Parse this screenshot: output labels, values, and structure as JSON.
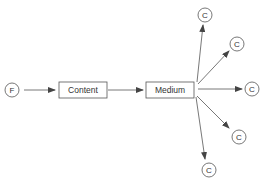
{
  "diagram": {
    "colors": {
      "stroke": "#555555",
      "text": "#333333",
      "background": "#ffffff"
    },
    "source": {
      "label": "F",
      "cx": 12,
      "cy": 90,
      "r": 7
    },
    "content_box": {
      "label": "Content",
      "x": 59,
      "y": 82,
      "w": 48,
      "h": 16
    },
    "medium_box": {
      "label": "Medium",
      "x": 146,
      "y": 82,
      "w": 48,
      "h": 16
    },
    "consumers": [
      {
        "label": "C",
        "cx": 205,
        "cy": 15,
        "r": 7
      },
      {
        "label": "C",
        "cx": 237,
        "cy": 44,
        "r": 7
      },
      {
        "label": "C",
        "cx": 252,
        "cy": 89,
        "r": 7
      },
      {
        "label": "C",
        "cx": 239,
        "cy": 137,
        "r": 7
      },
      {
        "label": "C",
        "cx": 209,
        "cy": 170,
        "r": 7
      }
    ],
    "edges": [
      {
        "from": "F",
        "to": "Content",
        "x1": 24,
        "y1": 90,
        "x2": 55,
        "y2": 90
      },
      {
        "from": "Content",
        "to": "Medium",
        "x1": 108,
        "y1": 90,
        "x2": 143,
        "y2": 90
      },
      {
        "from": "Medium",
        "to": "C1",
        "x1": 197,
        "y1": 82,
        "x2": 203,
        "y2": 25
      },
      {
        "from": "Medium",
        "to": "C2",
        "x1": 198,
        "y1": 84,
        "x2": 229,
        "y2": 51
      },
      {
        "from": "Medium",
        "to": "C3",
        "x1": 198,
        "y1": 89,
        "x2": 242,
        "y2": 89
      },
      {
        "from": "Medium",
        "to": "C4",
        "x1": 197,
        "y1": 96,
        "x2": 229,
        "y2": 128
      },
      {
        "from": "Medium",
        "to": "C5",
        "x1": 196,
        "y1": 97,
        "x2": 205,
        "y2": 159
      }
    ]
  }
}
